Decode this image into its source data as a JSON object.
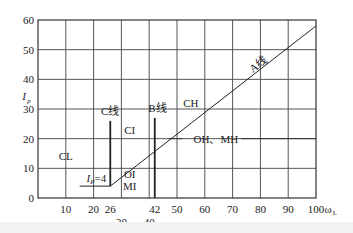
{
  "chart_data": {
    "type": "line",
    "title": "",
    "xlabel": "ωL",
    "ylabel": "Ip",
    "xlim": [
      0,
      100
    ],
    "ylim": [
      0,
      60
    ],
    "grid": true,
    "x_ticks": [
      10,
      20,
      26,
      30,
      42,
      40,
      50,
      60,
      70,
      80,
      90,
      100
    ],
    "x_tick_labels_row1": [
      "10",
      "20",
      "26",
      "42",
      "50",
      "60",
      "70",
      "80",
      "90",
      "100"
    ],
    "x_tick_labels_row2": [
      "30",
      "40"
    ],
    "y_ticks": [
      0,
      10,
      20,
      30,
      40,
      50,
      60
    ],
    "lines": [
      {
        "name": "A线",
        "points": [
          [
            26,
            4
          ],
          [
            100,
            58
          ]
        ]
      },
      {
        "name": "Ip=4",
        "points": [
          [
            15,
            4
          ],
          [
            26,
            4
          ]
        ]
      },
      {
        "name": "C线",
        "points": [
          [
            26,
            4
          ],
          [
            26,
            26
          ]
        ]
      },
      {
        "name": "B线",
        "points": [
          [
            42,
            0
          ],
          [
            42,
            27
          ]
        ]
      }
    ],
    "regions": [
      {
        "label": "CL",
        "x": 10,
        "y": 14
      },
      {
        "label": "CI",
        "x": 33,
        "y": 23
      },
      {
        "label": "CH",
        "x": 55,
        "y": 32
      },
      {
        "label": "OI",
        "x": 33,
        "y": 8
      },
      {
        "label": "MI",
        "x": 33,
        "y": 4
      },
      {
        "label": "OH、MH",
        "x": 64,
        "y": 20
      }
    ]
  },
  "labels": {
    "a_line": "A线",
    "b_line": "B线",
    "c_line": "C线",
    "ip4": "Ip=4",
    "x_axis": "ωL",
    "y_axis": "Ip"
  }
}
